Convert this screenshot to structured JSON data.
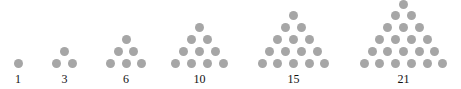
{
  "diagram": {
    "dot_color": "#a6a6a6",
    "figures": [
      {
        "label": "1",
        "rows": 1,
        "center_x": 18
      },
      {
        "label": "3",
        "rows": 2,
        "center_x": 64.5
      },
      {
        "label": "6",
        "rows": 3,
        "center_x": 126
      },
      {
        "label": "10",
        "rows": 4,
        "center_x": 199.5
      },
      {
        "label": "15",
        "rows": 5,
        "center_x": 293.5
      },
      {
        "label": "21",
        "rows": 6,
        "center_x": 403.5
      }
    ],
    "layout": {
      "bottom_row_y": 63,
      "dx": 15.7,
      "dy": 11.8,
      "dot_size": 9
    }
  }
}
